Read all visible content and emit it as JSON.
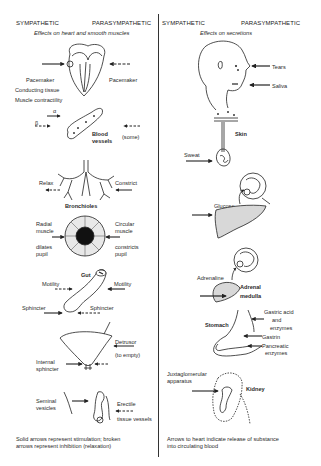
{
  "left_panel": {
    "header_left": "SYMPATHETIC",
    "header_right": "PARASYMPATHETIC",
    "subtitle": "Effects on heart and smooth muscles",
    "heart": {
      "pacemaker_left": "Pacemaker",
      "pacemaker_right": "Pacemaker",
      "conducting": "Conducting tissue",
      "contractility": "Muscle contractility"
    },
    "blood_vessels": {
      "alpha": "α",
      "beta": "β",
      "label": "Blood vessels",
      "label_line1": "Blood",
      "label_line2": "vessels",
      "some": "(some)"
    },
    "bronchioles": {
      "relax": "Relax",
      "constrict": "Constrict",
      "label": "Bronchioles"
    },
    "pupil": {
      "radial_1": "Radial",
      "radial_2": "muscle",
      "dilates_1": "dilates",
      "dilates_2": "pupil",
      "circular_1": "Circular",
      "circular_2": "muscle",
      "constricts_1": "constricts",
      "constricts_2": "pupil"
    },
    "gut": {
      "label": "Gut",
      "motility_left": "Motility",
      "motility_right": "Motility",
      "sphincter_left": "Sphincter",
      "sphincter_right": "Sphincter"
    },
    "bladder": {
      "label": "Bladder",
      "detrusor_1": "Detrusor",
      "detrusor_2": "(to empty)",
      "internal_1": "Internal",
      "internal_2": "sphincter"
    },
    "genital": {
      "seminal_1": "Seminal",
      "seminal_2": "vesicles",
      "erectile_1": "Erectile",
      "erectile_2": "tissue vessels"
    },
    "footnote_1": "Solid arrows represent stimulation; broken",
    "footnote_2": "arrows represent inhibition (relaxation)"
  },
  "right_panel": {
    "header_left": "SYMPATHETIC",
    "header_right": "PARASYMPATHETIC",
    "subtitle": "Effects on secretions",
    "face": {
      "tears": "Tears",
      "saliva": "Saliva"
    },
    "skin": {
      "label": "Skin",
      "sweat": "Sweat"
    },
    "liver": {
      "label": "Liver",
      "glucose": "Glucose"
    },
    "adrenal": {
      "adrenaline": "Adrenaline",
      "label_1": "Adrenal",
      "label_2": "medulla"
    },
    "stomach": {
      "label": "Stomach",
      "gastric_1": "Gastric acid",
      "gastric_2": "and",
      "gastric_3": "enzymes",
      "gastrin": "Gastrin",
      "pancreatic_1": "Pancreatic",
      "pancreatic_2": "enzymes"
    },
    "kidney": {
      "juxta_1": "Juxtaglomerular",
      "juxta_2": "apparatus",
      "label": "Kidney"
    },
    "footnote_1": "Arrows to heart indicate release of substance",
    "footnote_2": "into circulating blood"
  },
  "colors": {
    "ink": "#222222",
    "background": "#ffffff",
    "fill_gray": "#d8d8d8"
  }
}
